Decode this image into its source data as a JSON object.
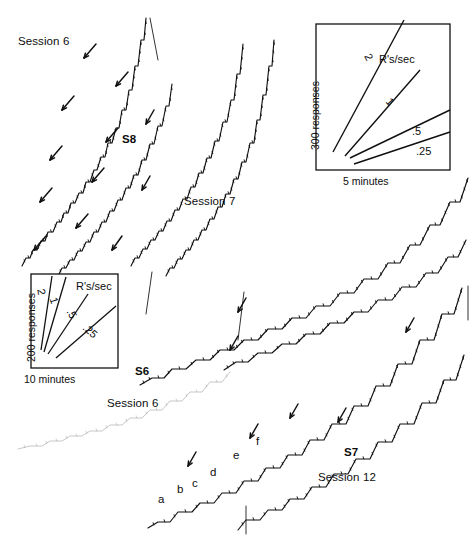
{
  "figure": {
    "background_color": "#ffffff",
    "ink_color": "#111111",
    "faint_ink_color": "#8a8a8a",
    "width": 474,
    "height": 541
  },
  "panels": {
    "top_left": {
      "session_label": "Session 6",
      "subject_label": "S8"
    },
    "top_middle": {
      "session_label": "Session 7"
    },
    "middle_left": {
      "subject_label": "S6",
      "session_label": "Session 6"
    },
    "bottom_right": {
      "subject_label": "S7",
      "session_label": "Session 12"
    }
  },
  "legend_boxes": [
    {
      "id": "legend-top-right",
      "rate_header": "R's/sec",
      "y_axis_label": "300 responses",
      "x_axis_label": "5 minutes",
      "rate_labels": [
        "2",
        "1",
        ".5",
        ".25"
      ]
    },
    {
      "id": "legend-left",
      "rate_header": "R's/sec",
      "y_axis_label": "200 responses",
      "x_axis_label": "10 minutes",
      "rate_labels": [
        "2",
        "1",
        ".5",
        ".25"
      ]
    }
  ],
  "point_markers": [
    {
      "label": "a",
      "x": 158,
      "y": 494
    },
    {
      "label": "b",
      "x": 177,
      "y": 484
    },
    {
      "label": "c",
      "x": 192,
      "y": 478
    },
    {
      "label": "d",
      "x": 210,
      "y": 467
    },
    {
      "label": "e",
      "x": 233,
      "y": 450
    },
    {
      "label": "f",
      "x": 256,
      "y": 436
    }
  ],
  "chart_data": {
    "type": "line",
    "xlabel": "Time",
    "ylabel": "Cumulative responses",
    "grid": false,
    "legend_position": "inset",
    "rate_calibration": {
      "units": "R's/sec",
      "values": [
        2,
        1,
        0.5,
        0.25
      ]
    },
    "series": [
      {
        "name": "S8 Session 6 - record 1",
        "subject": "S8",
        "session": "Session 6",
        "style": "dark",
        "points": [
          [
            22,
            266
          ],
          [
            26,
            258
          ],
          [
            30,
            258
          ],
          [
            33,
            250
          ],
          [
            37,
            250
          ],
          [
            41,
            241
          ],
          [
            45,
            241
          ],
          [
            48,
            232
          ],
          [
            53,
            232
          ],
          [
            57,
            222
          ],
          [
            61,
            222
          ],
          [
            64,
            213
          ],
          [
            68,
            213
          ],
          [
            71,
            203
          ],
          [
            75,
            203
          ],
          [
            79,
            193
          ],
          [
            83,
            193
          ],
          [
            86,
            182
          ],
          [
            90,
            182
          ],
          [
            94,
            170
          ],
          [
            97,
            170
          ],
          [
            101,
            157
          ],
          [
            105,
            157
          ],
          [
            108,
            143
          ],
          [
            112,
            143
          ],
          [
            116,
            128
          ],
          [
            119,
            128
          ],
          [
            122,
            110
          ],
          [
            126,
            110
          ],
          [
            129,
            90
          ],
          [
            132,
            90
          ],
          [
            135,
            66
          ],
          [
            138,
            66
          ],
          [
            141,
            40
          ],
          [
            144,
            40
          ],
          [
            146,
            18
          ]
        ]
      },
      {
        "name": "S8 Session 6 - record 2",
        "subject": "S8",
        "session": "Session 6",
        "style": "dark",
        "points": [
          [
            58,
            276
          ],
          [
            62,
            268
          ],
          [
            66,
            268
          ],
          [
            70,
            260
          ],
          [
            74,
            260
          ],
          [
            78,
            251
          ],
          [
            82,
            251
          ],
          [
            86,
            242
          ],
          [
            90,
            242
          ],
          [
            94,
            232
          ],
          [
            98,
            232
          ],
          [
            102,
            222
          ],
          [
            106,
            222
          ],
          [
            110,
            211
          ],
          [
            114,
            211
          ],
          [
            118,
            200
          ],
          [
            122,
            200
          ],
          [
            126,
            188
          ],
          [
            130,
            188
          ],
          [
            134,
            175
          ],
          [
            138,
            175
          ],
          [
            142,
            160
          ],
          [
            146,
            160
          ],
          [
            150,
            144
          ],
          [
            154,
            144
          ],
          [
            158,
            126
          ],
          [
            162,
            126
          ],
          [
            166,
            106
          ],
          [
            169,
            106
          ],
          [
            172,
            84
          ]
        ]
      },
      {
        "name": "S8 Session 7 - record 1",
        "subject": "S8",
        "session": "Session 7",
        "style": "dark",
        "points": [
          [
            131,
            266
          ],
          [
            135,
            258
          ],
          [
            139,
            258
          ],
          [
            143,
            249
          ],
          [
            147,
            249
          ],
          [
            151,
            240
          ],
          [
            155,
            240
          ],
          [
            159,
            231
          ],
          [
            163,
            231
          ],
          [
            167,
            221
          ],
          [
            171,
            221
          ],
          [
            175,
            210
          ],
          [
            179,
            210
          ],
          [
            183,
            199
          ],
          [
            187,
            199
          ],
          [
            191,
            187
          ],
          [
            195,
            187
          ],
          [
            199,
            173
          ],
          [
            203,
            173
          ],
          [
            207,
            158
          ],
          [
            211,
            158
          ],
          [
            215,
            141
          ],
          [
            219,
            141
          ],
          [
            223,
            122
          ],
          [
            227,
            122
          ],
          [
            231,
            100
          ],
          [
            234,
            100
          ],
          [
            237,
            74
          ],
          [
            240,
            74
          ],
          [
            243,
            44
          ]
        ]
      },
      {
        "name": "S8 Session 7 - record 2",
        "subject": "S8",
        "session": "Session 7",
        "style": "dark",
        "points": [
          [
            166,
            276
          ],
          [
            170,
            268
          ],
          [
            174,
            268
          ],
          [
            178,
            259
          ],
          [
            182,
            259
          ],
          [
            186,
            250
          ],
          [
            190,
            250
          ],
          [
            194,
            240
          ],
          [
            198,
            240
          ],
          [
            202,
            230
          ],
          [
            206,
            230
          ],
          [
            210,
            219
          ],
          [
            214,
            219
          ],
          [
            218,
            207
          ],
          [
            222,
            207
          ],
          [
            226,
            194
          ],
          [
            230,
            194
          ],
          [
            234,
            179
          ],
          [
            238,
            179
          ],
          [
            242,
            162
          ],
          [
            246,
            162
          ],
          [
            250,
            143
          ],
          [
            254,
            143
          ],
          [
            257,
            120
          ],
          [
            260,
            120
          ],
          [
            263,
            95
          ],
          [
            266,
            95
          ],
          [
            269,
            66
          ],
          [
            272,
            66
          ],
          [
            274,
            40
          ]
        ]
      },
      {
        "name": "S6 Session 6 - record 1",
        "subject": "S6",
        "session": "Session 6",
        "style": "dark",
        "points": [
          [
            140,
            385
          ],
          [
            152,
            378
          ],
          [
            164,
            378
          ],
          [
            172,
            369
          ],
          [
            186,
            369
          ],
          [
            196,
            360
          ],
          [
            210,
            360
          ],
          [
            220,
            350
          ],
          [
            234,
            350
          ],
          [
            244,
            340
          ],
          [
            258,
            340
          ],
          [
            268,
            329
          ],
          [
            282,
            329
          ],
          [
            292,
            318
          ],
          [
            306,
            318
          ],
          [
            316,
            306
          ],
          [
            330,
            306
          ],
          [
            340,
            293
          ],
          [
            354,
            293
          ],
          [
            364,
            279
          ],
          [
            378,
            279
          ],
          [
            388,
            263
          ],
          [
            400,
            263
          ],
          [
            410,
            245
          ],
          [
            420,
            245
          ],
          [
            430,
            225
          ],
          [
            440,
            225
          ],
          [
            450,
            202
          ],
          [
            460,
            202
          ],
          [
            468,
            178
          ]
        ]
      },
      {
        "name": "S6 Session 6 - record 2",
        "subject": "S6",
        "session": "Session 6",
        "style": "dark",
        "points": [
          [
            224,
            370
          ],
          [
            236,
            362
          ],
          [
            248,
            362
          ],
          [
            258,
            353
          ],
          [
            272,
            353
          ],
          [
            282,
            344
          ],
          [
            296,
            344
          ],
          [
            306,
            334
          ],
          [
            320,
            334
          ],
          [
            330,
            323
          ],
          [
            344,
            323
          ],
          [
            354,
            312
          ],
          [
            368,
            312
          ],
          [
            378,
            300
          ],
          [
            392,
            300
          ],
          [
            402,
            287
          ],
          [
            416,
            287
          ],
          [
            426,
            273
          ],
          [
            438,
            273
          ],
          [
            448,
            257
          ],
          [
            458,
            257
          ],
          [
            466,
            240
          ]
        ]
      },
      {
        "name": "S6 Session 6 - faint baseline",
        "subject": "S6",
        "session": "Session 6",
        "style": "faint",
        "points": [
          [
            18,
            449
          ],
          [
            30,
            446
          ],
          [
            42,
            446
          ],
          [
            50,
            441
          ],
          [
            62,
            441
          ],
          [
            70,
            436
          ],
          [
            82,
            436
          ],
          [
            90,
            431
          ],
          [
            102,
            431
          ],
          [
            110,
            425
          ],
          [
            122,
            425
          ],
          [
            130,
            418
          ],
          [
            142,
            418
          ],
          [
            150,
            410
          ],
          [
            162,
            410
          ],
          [
            170,
            401
          ],
          [
            182,
            401
          ],
          [
            190,
            392
          ],
          [
            202,
            392
          ],
          [
            210,
            382
          ],
          [
            222,
            382
          ],
          [
            230,
            372
          ]
        ]
      },
      {
        "name": "S7 Session 12 - record 1",
        "subject": "S7",
        "session": "Session 12",
        "style": "dark",
        "points": [
          [
            148,
            528
          ],
          [
            158,
            522
          ],
          [
            170,
            522
          ],
          [
            178,
            512
          ],
          [
            192,
            512
          ],
          [
            200,
            503
          ],
          [
            214,
            503
          ],
          [
            222,
            493
          ],
          [
            236,
            493
          ],
          [
            244,
            481
          ],
          [
            258,
            481
          ],
          [
            266,
            468
          ],
          [
            280,
            468
          ],
          [
            288,
            455
          ],
          [
            302,
            455
          ],
          [
            310,
            440
          ],
          [
            324,
            440
          ],
          [
            332,
            424
          ],
          [
            346,
            424
          ],
          [
            354,
            406
          ],
          [
            368,
            406
          ],
          [
            376,
            386
          ],
          [
            390,
            386
          ],
          [
            398,
            364
          ],
          [
            412,
            364
          ],
          [
            420,
            340
          ],
          [
            434,
            340
          ],
          [
            442,
            314
          ],
          [
            454,
            314
          ],
          [
            462,
            288
          ]
        ]
      },
      {
        "name": "S7 Session 12 - record 2",
        "subject": "S7",
        "session": "Session 12",
        "style": "dark",
        "points": [
          [
            238,
            530
          ],
          [
            246,
            520
          ],
          [
            260,
            520
          ],
          [
            268,
            510
          ],
          [
            282,
            510
          ],
          [
            290,
            499
          ],
          [
            304,
            499
          ],
          [
            312,
            487
          ],
          [
            326,
            487
          ],
          [
            334,
            474
          ],
          [
            348,
            474
          ],
          [
            356,
            459
          ],
          [
            370,
            459
          ],
          [
            378,
            442
          ],
          [
            392,
            442
          ],
          [
            400,
            424
          ],
          [
            414,
            424
          ],
          [
            422,
            403
          ],
          [
            436,
            403
          ],
          [
            444,
            380
          ],
          [
            456,
            380
          ],
          [
            464,
            355
          ]
        ]
      }
    ]
  }
}
